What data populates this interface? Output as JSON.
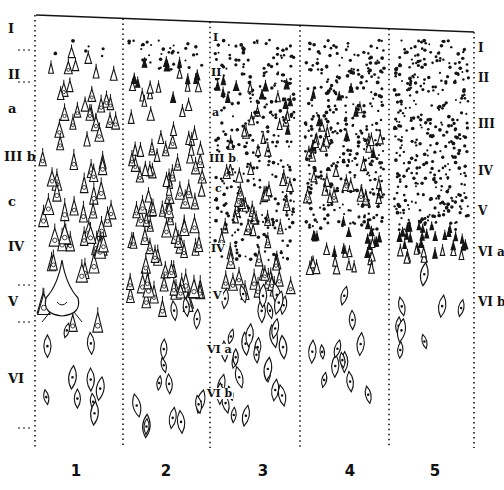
{
  "figure": {
    "ink_color": "#141414",
    "background": "#ffffff",
    "left_layer_labels": [
      {
        "id": "I",
        "text": "I",
        "y": 22
      },
      {
        "id": "II",
        "text": "II",
        "y": 68
      },
      {
        "id": "IIIa",
        "text": "a",
        "y": 102
      },
      {
        "id": "IIIb",
        "text": "III b",
        "y": 150
      },
      {
        "id": "IIIc",
        "text": "c",
        "y": 195
      },
      {
        "id": "IV",
        "text": "IV",
        "y": 240
      },
      {
        "id": "V",
        "text": "V",
        "y": 295
      },
      {
        "id": "VI",
        "text": "VI",
        "y": 372
      }
    ],
    "right_layer_labels": [
      {
        "id": "I",
        "text": "I",
        "y": 42
      },
      {
        "id": "II",
        "text": "II",
        "y": 72
      },
      {
        "id": "III",
        "text": "III",
        "y": 118
      },
      {
        "id": "IV",
        "text": "IV",
        "y": 165
      },
      {
        "id": "V",
        "text": "V",
        "y": 205
      },
      {
        "id": "VIa",
        "text": "VI a",
        "y": 246
      },
      {
        "id": "VIb",
        "text": "VI b",
        "y": 296
      }
    ],
    "inner_labels": [
      {
        "text": "I",
        "x": 212,
        "y": 32
      },
      {
        "text": "II",
        "x": 210,
        "y": 67
      },
      {
        "text": "a",
        "x": 211,
        "y": 107
      },
      {
        "text": "III b",
        "x": 208,
        "y": 153
      },
      {
        "text": "c",
        "x": 214,
        "y": 183
      },
      {
        "text": "IV",
        "x": 210,
        "y": 243
      },
      {
        "text": "V",
        "x": 212,
        "y": 290
      },
      {
        "text": "VI a",
        "x": 206,
        "y": 344
      },
      {
        "text": "VI b",
        "x": 206,
        "y": 388
      }
    ],
    "column_numbers": [
      {
        "text": "1",
        "x": 66
      },
      {
        "text": "2",
        "x": 156
      },
      {
        "text": "3",
        "x": 253
      },
      {
        "text": "4",
        "x": 340
      },
      {
        "text": "5",
        "x": 425
      }
    ],
    "column_dividers_x": [
      35,
      123,
      210,
      300,
      389,
      474
    ],
    "top_boundary": {
      "x1": 36,
      "y1": 15,
      "x2": 474,
      "y2": 32
    },
    "columns": [
      {
        "x0": 38,
        "x1": 120,
        "pyramids": [
          {
            "y0": 40,
            "y1": 330,
            "n": 70,
            "size": [
              6,
              24
            ]
          }
        ],
        "dots": {
          "y0": 40,
          "y1": 60,
          "n": 6
        },
        "fusiform": {
          "y0": 330,
          "y1": 430,
          "n": 10
        },
        "giant": {
          "x": 62,
          "y": 300
        }
      },
      {
        "x0": 126,
        "x1": 207,
        "pyramids": [
          {
            "y0": 60,
            "y1": 310,
            "n": 110,
            "size": [
              5,
              20
            ]
          }
        ],
        "dots": {
          "y0": 40,
          "y1": 70,
          "n": 40
        },
        "fusiform": {
          "y0": 300,
          "y1": 430,
          "n": 14
        }
      },
      {
        "x0": 213,
        "x1": 297,
        "pyramids": [
          {
            "y0": 80,
            "y1": 300,
            "n": 70,
            "size": [
              5,
              18
            ]
          }
        ],
        "dots": {
          "y0": 40,
          "y1": 260,
          "n": 320
        },
        "fusiform": {
          "y0": 290,
          "y1": 420,
          "n": 30
        }
      },
      {
        "x0": 303,
        "x1": 386,
        "pyramids": [
          {
            "y0": 80,
            "y1": 200,
            "n": 40,
            "size": [
              5,
              14
            ]
          },
          {
            "y0": 220,
            "y1": 270,
            "n": 30,
            "size": [
              5,
              12
            ]
          }
        ],
        "dots": {
          "y0": 40,
          "y1": 230,
          "n": 340
        },
        "fusiform": {
          "y0": 260,
          "y1": 400,
          "n": 12
        }
      },
      {
        "x0": 392,
        "x1": 471,
        "pyramids": [
          {
            "y0": 225,
            "y1": 260,
            "n": 35,
            "size": [
              5,
              11
            ]
          }
        ],
        "dots": {
          "y0": 40,
          "y1": 230,
          "n": 360
        },
        "fusiform": {
          "y0": 260,
          "y1": 350,
          "n": 8
        }
      }
    ]
  }
}
